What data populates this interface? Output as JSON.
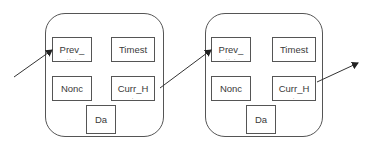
{
  "diagram": {
    "type": "blockchain-linked-blocks",
    "blocks": [
      {
        "id": "block-1",
        "fields": {
          "prev": {
            "label": "Prev_",
            "sub": ".. ."
          },
          "timestamp": {
            "label": "Timest",
            "sub": ""
          },
          "nonce": {
            "label": "Nonc",
            "sub": ""
          },
          "curr": {
            "label": "Curr_H",
            "sub": "."
          },
          "data": {
            "label": "Da",
            "sub": ""
          }
        }
      },
      {
        "id": "block-2",
        "fields": {
          "prev": {
            "label": "Prev_",
            "sub": ".. ."
          },
          "timestamp": {
            "label": "Timest",
            "sub": ""
          },
          "nonce": {
            "label": "Nonc",
            "sub": ""
          },
          "curr": {
            "label": "Curr_H",
            "sub": "."
          },
          "data": {
            "label": "Da",
            "sub": ""
          }
        }
      }
    ],
    "arrows": [
      {
        "from": "external-left",
        "to": "block-1.prev"
      },
      {
        "from": "block-1.curr",
        "to": "block-2.prev"
      },
      {
        "from": "block-2.curr",
        "to": "external-right"
      }
    ],
    "colors": {
      "stroke": "#555555",
      "arrow": "#333333",
      "text": "#3a3a3a",
      "background": "#ffffff"
    }
  }
}
